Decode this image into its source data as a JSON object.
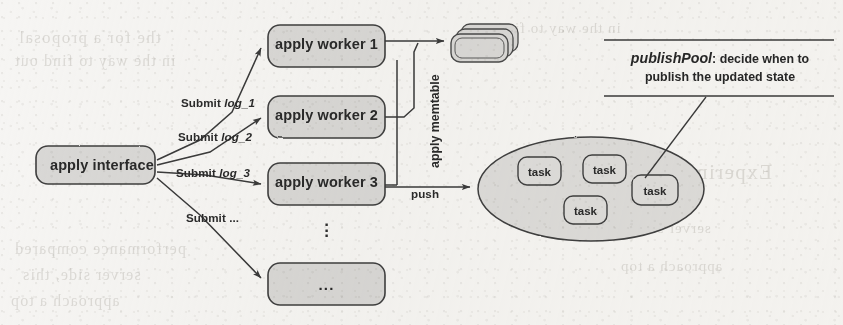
{
  "diagram": {
    "colors": {
      "paper": "#f6f5f3",
      "node_fill": "#d9d8d6",
      "node_stroke": "#4a4a4a",
      "pool_fill": "#d9d8d6",
      "ink": "#2a2a2a"
    },
    "nodes": {
      "apply_interface": "apply interface",
      "worker_1": "apply worker 1",
      "worker_2": "apply worker 2",
      "worker_3": "apply worker 3",
      "worker_more": "...",
      "memtable_stack": "",
      "tasks": [
        "task",
        "task",
        "task",
        "task"
      ]
    },
    "edges": {
      "submit_log_1": {
        "prefix": "Submit",
        "arg": "log_1"
      },
      "submit_log_2": {
        "prefix": "Submit",
        "arg": "log_2"
      },
      "submit_log_3": {
        "prefix": "Submit",
        "arg": "log_3"
      },
      "submit_more": {
        "prefix": "Submit ...",
        "arg": ""
      },
      "apply_memtable": "apply memtable",
      "push": "push"
    },
    "annotation": {
      "term": "publishPool",
      "separator": ":",
      "text": "decide when to publish the updated state",
      "line1_suffix": "decide when to",
      "line2": "publish the updated state"
    },
    "vertical_ellipsis": "⋮",
    "ghost_text": [
      "the for a proposal",
      "in the way to find out",
      "Experiment",
      "performance compared",
      "server side, this",
      "approach a top"
    ]
  }
}
